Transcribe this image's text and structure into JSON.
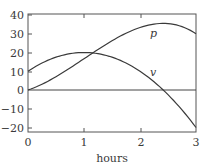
{
  "chart_data": {
    "type": "line",
    "title": "",
    "xlabel": "hours",
    "ylabel": "",
    "xlim": [
      0,
      3
    ],
    "ylim": [
      -22,
      40
    ],
    "xticks": [
      0,
      1,
      2,
      3
    ],
    "xtick_labels": [
      "0",
      "1",
      "2",
      "3"
    ],
    "yticks": [
      -20,
      -10,
      0,
      10,
      20,
      30,
      40
    ],
    "ytick_labels": [
      "−20",
      "−10",
      "0",
      "10",
      "20",
      "30",
      "40"
    ],
    "grid": false,
    "legend": "none (inline curve labels)",
    "reference_lines": [
      {
        "type": "horizontal",
        "y": 0
      }
    ],
    "series": [
      {
        "name": "p",
        "label": "p",
        "x": [
          0,
          0.25,
          0.5,
          0.75,
          1,
          1.25,
          1.5,
          1.75,
          2,
          2.25,
          2.5,
          2.75,
          3
        ],
        "values": [
          0,
          2.6,
          6.3,
          11.0,
          16.7,
          23.0,
          29.4,
          27.0,
          33.3,
          35.4,
          35.8,
          34.2,
          30.0
        ]
      },
      {
        "name": "v",
        "label": "v",
        "x": [
          0,
          0.25,
          0.5,
          0.75,
          1,
          1.25,
          1.5,
          1.75,
          2,
          2.25,
          2.5,
          2.75,
          3
        ],
        "values": [
          10,
          14.4,
          17.5,
          19.4,
          20,
          19.4,
          17.5,
          14.4,
          10,
          4.4,
          -2.5,
          -10.6,
          -20
        ]
      }
    ],
    "annotations": [
      {
        "text": "p",
        "near_x": 2.2,
        "near_y": 30.5
      },
      {
        "text": "v",
        "near_x": 2.2,
        "near_y": 9.5
      }
    ]
  },
  "axes": {
    "xlabel": "hours",
    "xtick_labels": [
      "0",
      "1",
      "2",
      "3"
    ],
    "ytick_labels": [
      "40",
      "30",
      "20",
      "10",
      "0",
      "−10",
      "−20"
    ]
  },
  "labels": {
    "p": "p",
    "v": "v"
  },
  "colors": {
    "line": "#3a3a3a",
    "frame": "#555555"
  }
}
